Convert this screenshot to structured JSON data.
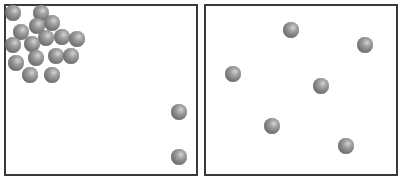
{
  "figure": {
    "left_container": {
      "rect": {
        "x": 4,
        "y": 4,
        "w": 194,
        "h": 172
      },
      "particle_count": 18,
      "particles": [
        {
          "x": 13,
          "y": 13
        },
        {
          "x": 41,
          "y": 13
        },
        {
          "x": 37,
          "y": 26
        },
        {
          "x": 52,
          "y": 23
        },
        {
          "x": 21,
          "y": 32
        },
        {
          "x": 46,
          "y": 38
        },
        {
          "x": 62,
          "y": 37
        },
        {
          "x": 77,
          "y": 39
        },
        {
          "x": 13,
          "y": 45
        },
        {
          "x": 32,
          "y": 44
        },
        {
          "x": 16,
          "y": 63
        },
        {
          "x": 36,
          "y": 58
        },
        {
          "x": 56,
          "y": 56
        },
        {
          "x": 71,
          "y": 56
        },
        {
          "x": 30,
          "y": 75
        },
        {
          "x": 52,
          "y": 75
        },
        {
          "x": 179,
          "y": 112
        },
        {
          "x": 179,
          "y": 157
        }
      ]
    },
    "right_container": {
      "rect": {
        "x": 204,
        "y": 4,
        "w": 194,
        "h": 172
      },
      "particle_count": 6,
      "particles": [
        {
          "x": 291,
          "y": 30
        },
        {
          "x": 365,
          "y": 45
        },
        {
          "x": 233,
          "y": 74
        },
        {
          "x": 321,
          "y": 86
        },
        {
          "x": 272,
          "y": 126
        },
        {
          "x": 346,
          "y": 146
        }
      ]
    },
    "colors": {
      "border": "#3a3a3a",
      "particle": "#808080",
      "background": "#ffffff"
    }
  }
}
